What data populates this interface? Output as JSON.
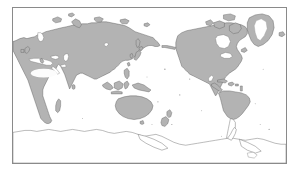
{
  "figure": {
    "kind": "world-map",
    "title": "",
    "projection": "equirectangular",
    "centered_on": "Pacific Ocean",
    "center_longitude": 180,
    "frame": {
      "visible": true,
      "border_color": "#8a8a8a",
      "background": "#ffffff"
    }
  },
  "legend": {
    "visible": false,
    "entries": []
  },
  "graticule": {
    "visible": false,
    "lat_lines": [],
    "lon_lines": []
  },
  "style": {
    "land_fill": "#b3b3b3",
    "land_stroke": "#5d5d5d",
    "ocean_fill": "#ffffff",
    "ice_fill": "#ffffff",
    "desert_fill": "#fcfcfc",
    "unshaded_land_fill": "#ffffff",
    "unshaded_land_stroke": "#6a6a6a"
  },
  "regions": [
    {
      "name": "Eurasia",
      "shading": "shaded"
    },
    {
      "name": "Africa",
      "shading": "shaded"
    },
    {
      "name": "Sahara",
      "shading": "unshaded-interior"
    },
    {
      "name": "North America",
      "shading": "shaded"
    },
    {
      "name": "Greenland",
      "shading": "shaded-with-ice-cap"
    },
    {
      "name": "South America",
      "shading": "partially-shaded"
    },
    {
      "name": "Australia",
      "shading": "shaded"
    },
    {
      "name": "New Zealand",
      "shading": "shaded"
    },
    {
      "name": "Indonesia and Philippines",
      "shading": "shaded"
    },
    {
      "name": "Japan",
      "shading": "shaded"
    },
    {
      "name": "Madagascar",
      "shading": "shaded"
    },
    {
      "name": "British Isles",
      "shading": "shaded"
    },
    {
      "name": "Antarctica",
      "shading": "outline-only"
    },
    {
      "name": "Arctic Islands",
      "shading": "shaded"
    },
    {
      "name": "Caribbean Islands",
      "shading": "shaded"
    }
  ],
  "labels": [],
  "annotations": [],
  "scale_bar": {
    "visible": false,
    "text": ""
  },
  "north_arrow": {
    "visible": false
  },
  "attribution": {
    "visible": false,
    "text": ""
  }
}
